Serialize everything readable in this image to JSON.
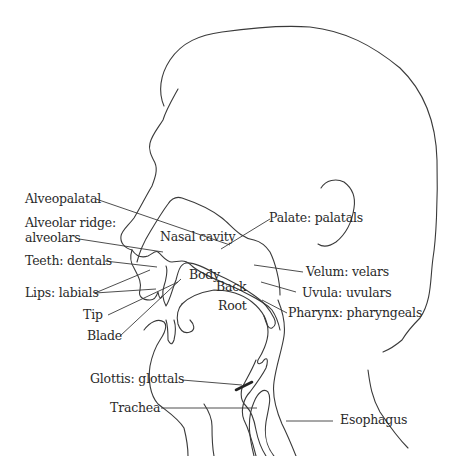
{
  "diagram": {
    "colors": {
      "line": "#3a3a3a",
      "text": "#2a2a2a",
      "background": "#ffffff"
    },
    "labels": {
      "nasal_cavity": "Nasal cavity",
      "alveopalatal": "Alveopalatal",
      "alveolar_ridge_line1": "Alveolar ridge:",
      "alveolar_ridge_line2": "alveolars",
      "teeth": "Teeth: dentals",
      "lips": "Lips: labials",
      "tip": "Tip",
      "blade": "Blade",
      "body": "Body",
      "back": "Back",
      "root": "Root",
      "palate": "Palate: palatals",
      "velum": "Velum: velars",
      "uvula": "Uvula: uvulars",
      "pharynx": "Pharynx: pharyngeals",
      "glottis": "Glottis: glottals",
      "trachea": "Trachea",
      "esophagus": "Esophagus"
    }
  }
}
